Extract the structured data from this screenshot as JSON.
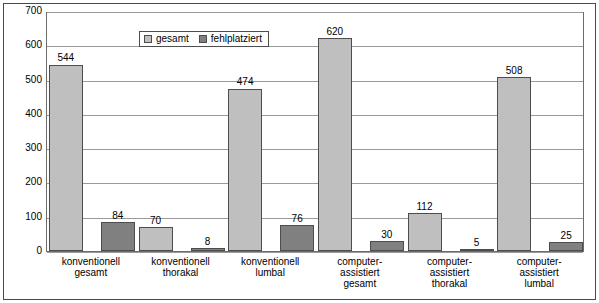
{
  "chart_data": {
    "type": "bar",
    "title": "",
    "xlabel": "",
    "ylabel": "",
    "ylim": [
      0,
      700
    ],
    "yticks": [
      0,
      100,
      200,
      300,
      400,
      500,
      600,
      700
    ],
    "grid": true,
    "legend_position": "top-left-inside",
    "categories": [
      [
        "konventionell",
        "gesamt"
      ],
      [
        "konventionell",
        "thorakal"
      ],
      [
        "konventionell",
        "lumbal"
      ],
      [
        "computer-",
        "assistiert",
        "gesamt"
      ],
      [
        "computer-",
        "assistiert",
        "thorakal"
      ],
      [
        "computer-",
        "assistiert",
        "lumbal"
      ]
    ],
    "series": [
      {
        "name": "gesamt",
        "color": "#bfbfbf",
        "values": [
          544,
          70,
          474,
          620,
          112,
          508
        ]
      },
      {
        "name": "fehlplatziert",
        "color": "#808080",
        "values": [
          84,
          8,
          76,
          30,
          5,
          25
        ]
      }
    ]
  },
  "legend": {
    "items": [
      {
        "label": "gesamt"
      },
      {
        "label": "fehlplatziert"
      }
    ]
  }
}
